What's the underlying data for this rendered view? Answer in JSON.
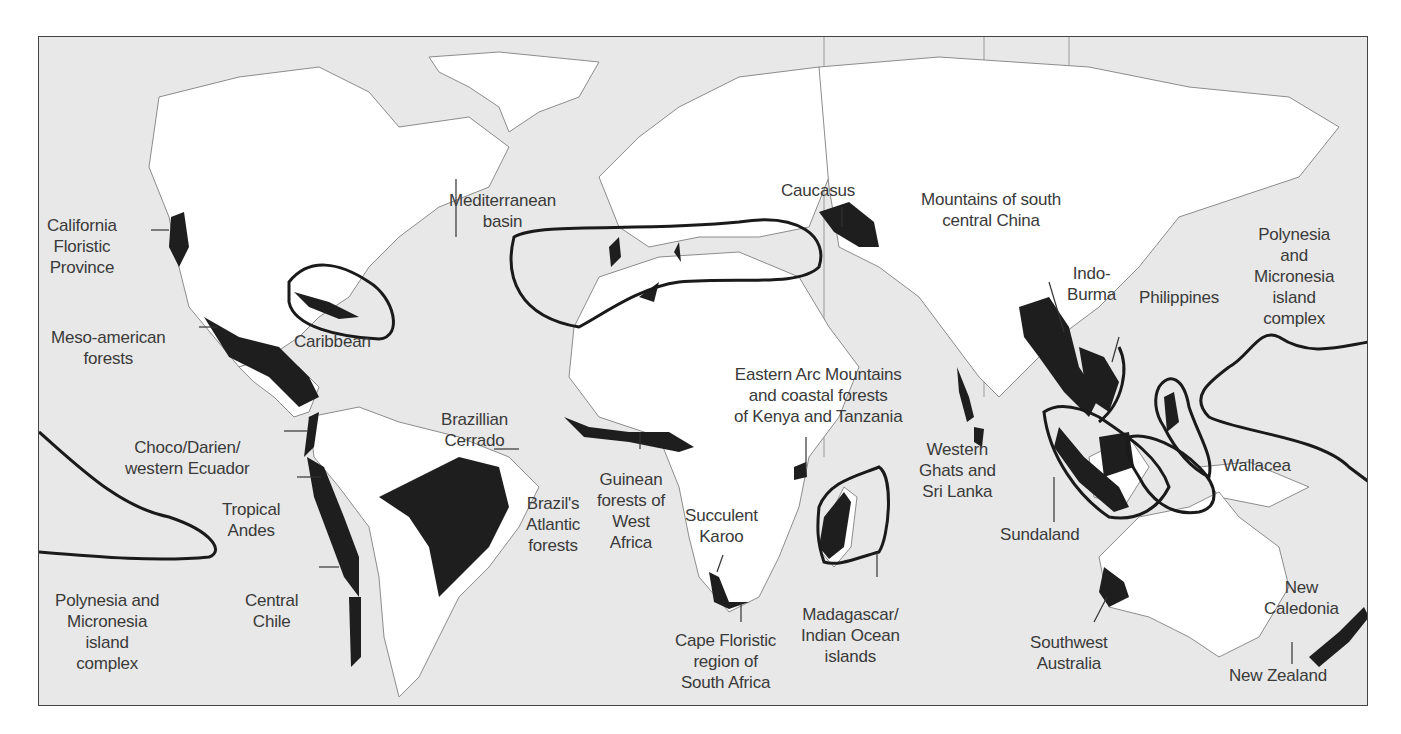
{
  "map": {
    "title": "Biodiversity hotspots of the world",
    "colors": {
      "ocean": "#e8e8e8",
      "land": "#ffffff",
      "hotspot": "#1e1e1e",
      "outline": "#1a1a1a",
      "label": "#3a3a3a"
    },
    "labels": {
      "california": "California\nFloristic\nProvince",
      "mesoamerica": "Meso-american\nforests",
      "caribbean": "Caribbean",
      "choco": "Choco/Darien/\nwestern Ecuador",
      "tropical_andes": "Tropical\nAndes",
      "polynesia_west": "Polynesia and\nMicronesia\nisland\ncomplex",
      "central_chile": "Central\nChile",
      "brazil_cerrado": "Brazillian\nCerrado",
      "brazil_atlantic": "Brazil's\nAtlantic\nforests",
      "mediterranean": "Mediterranean\nbasin",
      "guinean": "Guinean\nforests of\nWest\nAfrica",
      "succulent_karoo": "Succulent\nKaroo",
      "cape": "Cape Floristic\nregion of\nSouth Africa",
      "caucasus": "Caucasus",
      "eastern_arc": "Eastern Arc Mountains\nand coastal forests\nof Kenya and Tanzania",
      "madagascar": "Madagascar/\nIndian Ocean\nislands",
      "western_ghats": "Western\nGhats and\nSri Lanka",
      "south_china": "Mountains of south\ncentral China",
      "indo_burma": "Indo-\nBurma",
      "philippines": "Philippines",
      "polynesia_east": "Polynesia\nand\nMicronesia\nisland\ncomplex",
      "sundaland": "Sundaland",
      "wallacea": "Wallacea",
      "sw_australia": "Southwest\nAustralia",
      "new_caledonia": "New\nCaledonia",
      "new_zealand": "New Zealand"
    }
  }
}
